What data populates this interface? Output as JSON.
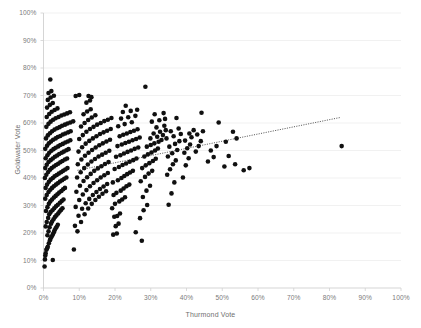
{
  "chart_data": {
    "type": "scatter",
    "title": "",
    "xlabel": "Thurmond Vote",
    "ylabel": "Goldwater Vote",
    "xlim": [
      0,
      100
    ],
    "ylim": [
      0,
      100
    ],
    "xticks": [
      "0%",
      "10%",
      "20%",
      "30%",
      "40%",
      "50%",
      "60%",
      "70%",
      "80%",
      "90%",
      "100%"
    ],
    "yticks": [
      "0%",
      "10%",
      "20%",
      "30%",
      "40%",
      "50%",
      "60%",
      "70%",
      "80%",
      "90%",
      "100%"
    ],
    "grid": "horizontal",
    "grid_color": "#ededed",
    "axis_color": "#d0d0d0",
    "point_color": "#101010",
    "point_size": 2.3,
    "legend": "none",
    "trendline": {
      "style": "dotted",
      "color": "#3f3f3f",
      "x_start": 9.5,
      "y_start": 42.8,
      "x_end": 83.0,
      "y_end": 62.0
    },
    "points": [
      [
        0.3,
        7.8
      ],
      [
        0.4,
        10.4
      ],
      [
        0.5,
        11.8
      ],
      [
        0.6,
        12.6
      ],
      [
        0.8,
        13.9
      ],
      [
        1.0,
        14.4
      ],
      [
        2.6,
        10.2
      ],
      [
        1.2,
        15.0
      ],
      [
        1.5,
        16.3
      ],
      [
        1.8,
        17.4
      ],
      [
        2.0,
        18.1
      ],
      [
        2.3,
        18.7
      ],
      [
        2.6,
        19.5
      ],
      [
        2.9,
        20.3
      ],
      [
        3.1,
        21.0
      ],
      [
        3.4,
        21.7
      ],
      [
        3.7,
        22.3
      ],
      [
        4.0,
        23.0
      ],
      [
        1.1,
        19.2
      ],
      [
        1.4,
        20.6
      ],
      [
        1.7,
        22.1
      ],
      [
        2.1,
        23.4
      ],
      [
        2.4,
        24.2
      ],
      [
        2.8,
        25.0
      ],
      [
        3.2,
        25.8
      ],
      [
        3.6,
        26.4
      ],
      [
        4.1,
        27.1
      ],
      [
        4.5,
        27.8
      ],
      [
        4.9,
        28.4
      ],
      [
        5.3,
        29.0
      ],
      [
        0.6,
        22.4
      ],
      [
        0.9,
        24.0
      ],
      [
        1.3,
        25.5
      ],
      [
        1.6,
        26.8
      ],
      [
        2.0,
        27.6
      ],
      [
        2.5,
        28.3
      ],
      [
        3.0,
        29.0
      ],
      [
        3.5,
        29.7
      ],
      [
        4.0,
        30.3
      ],
      [
        4.6,
        31.0
      ],
      [
        5.1,
        31.6
      ],
      [
        5.6,
        32.2
      ],
      [
        0.7,
        28.0
      ],
      [
        1.1,
        29.4
      ],
      [
        1.5,
        30.6
      ],
      [
        1.9,
        31.5
      ],
      [
        2.4,
        32.2
      ],
      [
        2.9,
        32.9
      ],
      [
        3.4,
        33.5
      ],
      [
        3.9,
        34.1
      ],
      [
        4.4,
        34.7
      ],
      [
        5.0,
        35.3
      ],
      [
        5.5,
        35.9
      ],
      [
        6.0,
        36.4
      ],
      [
        0.5,
        32.5
      ],
      [
        0.9,
        33.8
      ],
      [
        1.4,
        34.9
      ],
      [
        1.9,
        35.7
      ],
      [
        2.4,
        36.4
      ],
      [
        2.9,
        37.0
      ],
      [
        3.5,
        37.6
      ],
      [
        4.0,
        38.1
      ],
      [
        4.6,
        38.7
      ],
      [
        5.2,
        39.2
      ],
      [
        5.8,
        39.7
      ],
      [
        6.4,
        40.2
      ],
      [
        0.6,
        36.4
      ],
      [
        1.0,
        37.6
      ],
      [
        1.5,
        38.6
      ],
      [
        2.0,
        39.4
      ],
      [
        2.6,
        40.0
      ],
      [
        3.1,
        40.6
      ],
      [
        3.7,
        41.1
      ],
      [
        4.3,
        41.6
      ],
      [
        4.9,
        42.1
      ],
      [
        5.5,
        42.6
      ],
      [
        6.1,
        43.1
      ],
      [
        6.7,
        43.6
      ],
      [
        0.4,
        40.0
      ],
      [
        0.8,
        41.2
      ],
      [
        1.3,
        42.2
      ],
      [
        1.8,
        43.0
      ],
      [
        2.3,
        43.6
      ],
      [
        2.9,
        44.2
      ],
      [
        3.5,
        44.7
      ],
      [
        4.1,
        45.2
      ],
      [
        4.7,
        45.7
      ],
      [
        5.3,
        46.2
      ],
      [
        6.0,
        46.7
      ],
      [
        6.6,
        47.1
      ],
      [
        0.5,
        43.6
      ],
      [
        0.9,
        44.8
      ],
      [
        1.4,
        45.8
      ],
      [
        2.0,
        46.5
      ],
      [
        2.6,
        47.1
      ],
      [
        3.2,
        47.7
      ],
      [
        3.8,
        48.2
      ],
      [
        4.4,
        48.7
      ],
      [
        5.1,
        49.2
      ],
      [
        5.7,
        49.6
      ],
      [
        6.4,
        50.1
      ],
      [
        7.0,
        50.5
      ],
      [
        0.6,
        47.2
      ],
      [
        1.1,
        48.3
      ],
      [
        1.6,
        49.2
      ],
      [
        2.2,
        49.9
      ],
      [
        2.8,
        50.5
      ],
      [
        3.4,
        51.0
      ],
      [
        4.1,
        51.5
      ],
      [
        4.7,
        52.0
      ],
      [
        5.4,
        52.4
      ],
      [
        6.1,
        52.9
      ],
      [
        6.8,
        53.3
      ],
      [
        7.5,
        53.7
      ],
      [
        0.5,
        50.6
      ],
      [
        1.0,
        51.7
      ],
      [
        1.5,
        52.6
      ],
      [
        2.1,
        53.3
      ],
      [
        2.7,
        53.9
      ],
      [
        3.4,
        54.4
      ],
      [
        4.0,
        54.9
      ],
      [
        4.7,
        55.3
      ],
      [
        5.4,
        55.8
      ],
      [
        6.1,
        56.2
      ],
      [
        6.9,
        56.6
      ],
      [
        7.6,
        57.0
      ],
      [
        0.7,
        54.4
      ],
      [
        1.2,
        55.5
      ],
      [
        1.8,
        56.3
      ],
      [
        2.4,
        57.0
      ],
      [
        3.1,
        57.6
      ],
      [
        3.8,
        58.1
      ],
      [
        4.5,
        58.5
      ],
      [
        5.2,
        59.0
      ],
      [
        6.0,
        59.4
      ],
      [
        6.7,
        59.8
      ],
      [
        7.5,
        60.2
      ],
      [
        8.3,
        60.6
      ],
      [
        0.8,
        58.6
      ],
      [
        1.4,
        59.7
      ],
      [
        2.0,
        60.5
      ],
      [
        2.7,
        61.2
      ],
      [
        3.4,
        61.7
      ],
      [
        4.2,
        62.2
      ],
      [
        5.0,
        62.7
      ],
      [
        5.8,
        63.1
      ],
      [
        6.6,
        63.5
      ],
      [
        7.4,
        63.9
      ],
      [
        0.9,
        62.2
      ],
      [
        1.6,
        63.3
      ],
      [
        2.3,
        64.1
      ],
      [
        3.1,
        64.7
      ],
      [
        3.9,
        65.3
      ],
      [
        1.0,
        65.6
      ],
      [
        1.8,
        66.6
      ],
      [
        2.6,
        67.3
      ],
      [
        1.2,
        68.4
      ],
      [
        2.0,
        69.3
      ],
      [
        2.9,
        69.9
      ],
      [
        1.4,
        70.9
      ],
      [
        2.2,
        71.6
      ],
      [
        1.9,
        75.8
      ],
      [
        8.5,
        14.0
      ],
      [
        9.5,
        20.6
      ],
      [
        10.5,
        24.0
      ],
      [
        11.5,
        26.8
      ],
      [
        12.5,
        28.9
      ],
      [
        13.5,
        30.6
      ],
      [
        14.5,
        32.0
      ],
      [
        15.5,
        33.2
      ],
      [
        16.5,
        34.3
      ],
      [
        17.5,
        35.2
      ],
      [
        8.8,
        22.6
      ],
      [
        9.8,
        26.3
      ],
      [
        10.8,
        28.8
      ],
      [
        11.8,
        30.8
      ],
      [
        12.8,
        32.4
      ],
      [
        13.8,
        33.8
      ],
      [
        14.8,
        34.9
      ],
      [
        15.8,
        36.0
      ],
      [
        16.8,
        36.9
      ],
      [
        17.8,
        37.8
      ],
      [
        9.0,
        29.5
      ],
      [
        10.0,
        32.0
      ],
      [
        11.0,
        34.0
      ],
      [
        12.0,
        35.6
      ],
      [
        13.0,
        37.0
      ],
      [
        14.0,
        38.2
      ],
      [
        15.0,
        39.2
      ],
      [
        16.0,
        40.2
      ],
      [
        17.0,
        41.0
      ],
      [
        18.0,
        41.8
      ],
      [
        9.2,
        35.0
      ],
      [
        10.2,
        37.2
      ],
      [
        11.2,
        38.9
      ],
      [
        12.2,
        40.3
      ],
      [
        13.2,
        41.5
      ],
      [
        14.2,
        42.6
      ],
      [
        15.2,
        43.5
      ],
      [
        16.2,
        44.3
      ],
      [
        17.2,
        45.1
      ],
      [
        18.2,
        45.8
      ],
      [
        9.4,
        40.2
      ],
      [
        10.4,
        42.1
      ],
      [
        11.4,
        43.6
      ],
      [
        12.4,
        44.9
      ],
      [
        13.4,
        46.0
      ],
      [
        14.4,
        46.9
      ],
      [
        15.4,
        47.8
      ],
      [
        16.4,
        48.5
      ],
      [
        17.4,
        49.2
      ],
      [
        18.4,
        49.9
      ],
      [
        9.6,
        45.0
      ],
      [
        10.6,
        46.7
      ],
      [
        11.6,
        48.1
      ],
      [
        12.6,
        49.2
      ],
      [
        13.6,
        50.2
      ],
      [
        14.6,
        51.1
      ],
      [
        15.6,
        51.9
      ],
      [
        16.6,
        52.6
      ],
      [
        17.6,
        53.3
      ],
      [
        18.6,
        53.9
      ],
      [
        9.8,
        49.6
      ],
      [
        10.8,
        51.2
      ],
      [
        11.8,
        52.5
      ],
      [
        12.8,
        53.5
      ],
      [
        13.8,
        54.4
      ],
      [
        14.8,
        55.2
      ],
      [
        15.8,
        56.0
      ],
      [
        16.8,
        56.6
      ],
      [
        17.8,
        57.2
      ],
      [
        18.8,
        57.8
      ],
      [
        10.0,
        54.2
      ],
      [
        11.0,
        55.6
      ],
      [
        12.0,
        56.8
      ],
      [
        13.0,
        57.8
      ],
      [
        14.0,
        58.6
      ],
      [
        15.0,
        59.4
      ],
      [
        16.0,
        60.0
      ],
      [
        17.0,
        60.7
      ],
      [
        18.0,
        61.2
      ],
      [
        19.0,
        61.8
      ],
      [
        10.5,
        58.7
      ],
      [
        11.5,
        60.0
      ],
      [
        12.5,
        61.1
      ],
      [
        13.5,
        62.0
      ],
      [
        14.5,
        62.8
      ],
      [
        11.2,
        63.2
      ],
      [
        12.2,
        64.2
      ],
      [
        13.2,
        65.0
      ],
      [
        12.0,
        67.4
      ],
      [
        13.0,
        68.2
      ],
      [
        12.6,
        69.8
      ],
      [
        13.4,
        69.4
      ],
      [
        9.0,
        69.8
      ],
      [
        10.0,
        70.2
      ],
      [
        19.5,
        19.4
      ],
      [
        20.5,
        19.8
      ],
      [
        20.2,
        22.5
      ],
      [
        21.0,
        23.4
      ],
      [
        19.8,
        25.9
      ],
      [
        20.6,
        26.2
      ],
      [
        21.4,
        27.1
      ],
      [
        19.2,
        29.0
      ],
      [
        20.0,
        30.6
      ],
      [
        21.2,
        31.5
      ],
      [
        22.0,
        32.2
      ],
      [
        22.8,
        33.0
      ],
      [
        19.6,
        33.8
      ],
      [
        20.4,
        34.6
      ],
      [
        21.6,
        35.4
      ],
      [
        22.4,
        36.2
      ],
      [
        23.2,
        37.0
      ],
      [
        24.0,
        37.6
      ],
      [
        19.4,
        38.4
      ],
      [
        20.8,
        39.2
      ],
      [
        21.8,
        40.0
      ],
      [
        22.6,
        40.7
      ],
      [
        23.4,
        41.4
      ],
      [
        24.2,
        42.0
      ],
      [
        25.0,
        42.6
      ],
      [
        19.9,
        43.3
      ],
      [
        21.1,
        44.0
      ],
      [
        22.1,
        44.7
      ],
      [
        23.1,
        45.3
      ],
      [
        24.1,
        45.9
      ],
      [
        25.1,
        46.5
      ],
      [
        26.0,
        47.1
      ],
      [
        20.3,
        47.7
      ],
      [
        21.5,
        48.3
      ],
      [
        22.5,
        48.9
      ],
      [
        23.5,
        49.5
      ],
      [
        24.5,
        50.0
      ],
      [
        25.5,
        50.6
      ],
      [
        26.5,
        51.1
      ],
      [
        20.7,
        51.6
      ],
      [
        21.9,
        52.2
      ],
      [
        22.9,
        52.7
      ],
      [
        23.9,
        53.2
      ],
      [
        24.9,
        53.7
      ],
      [
        25.9,
        54.2
      ],
      [
        26.9,
        54.7
      ],
      [
        21.3,
        55.2
      ],
      [
        22.3,
        55.7
      ],
      [
        23.3,
        56.2
      ],
      [
        24.3,
        56.7
      ],
      [
        25.3,
        57.2
      ],
      [
        26.3,
        57.7
      ],
      [
        20.9,
        58.8
      ],
      [
        22.7,
        59.6
      ],
      [
        24.7,
        60.3
      ],
      [
        21.7,
        61.6
      ],
      [
        23.7,
        62.1
      ],
      [
        25.7,
        62.6
      ],
      [
        22.2,
        64.0
      ],
      [
        24.4,
        64.4
      ],
      [
        26.2,
        64.8
      ],
      [
        23.0,
        66.3
      ],
      [
        28.5,
        73.2
      ],
      [
        27.5,
        17.2
      ],
      [
        25.8,
        20.3
      ],
      [
        27.0,
        25.4
      ],
      [
        28.0,
        28.3
      ],
      [
        29.0,
        30.2
      ],
      [
        27.8,
        33.1
      ],
      [
        28.8,
        35.4
      ],
      [
        29.8,
        37.2
      ],
      [
        27.2,
        38.8
      ],
      [
        28.4,
        40.4
      ],
      [
        29.4,
        41.6
      ],
      [
        30.4,
        42.6
      ],
      [
        27.6,
        43.6
      ],
      [
        28.6,
        44.6
      ],
      [
        29.6,
        45.4
      ],
      [
        30.6,
        46.2
      ],
      [
        31.4,
        47.0
      ],
      [
        28.2,
        47.8
      ],
      [
        29.2,
        48.6
      ],
      [
        30.2,
        49.3
      ],
      [
        31.2,
        50.0
      ],
      [
        32.0,
        50.7
      ],
      [
        28.9,
        51.4
      ],
      [
        30.0,
        52.0
      ],
      [
        31.0,
        52.6
      ],
      [
        32.2,
        53.2
      ],
      [
        33.0,
        53.8
      ],
      [
        29.9,
        54.4
      ],
      [
        31.8,
        55.0
      ],
      [
        33.4,
        55.6
      ],
      [
        30.8,
        56.2
      ],
      [
        32.6,
        56.8
      ],
      [
        34.2,
        57.4
      ],
      [
        31.6,
        58.4
      ],
      [
        33.8,
        59.0
      ],
      [
        30.3,
        60.5
      ],
      [
        32.4,
        61.0
      ],
      [
        34.0,
        61.5
      ],
      [
        31.1,
        63.2
      ],
      [
        33.6,
        63.6
      ],
      [
        35.0,
        30.3
      ],
      [
        35.8,
        34.4
      ],
      [
        36.6,
        38.4
      ],
      [
        34.6,
        41.2
      ],
      [
        35.4,
        43.2
      ],
      [
        36.2,
        45.0
      ],
      [
        37.0,
        46.4
      ],
      [
        34.8,
        47.8
      ],
      [
        36.0,
        49.0
      ],
      [
        37.4,
        50.2
      ],
      [
        35.2,
        51.4
      ],
      [
        36.8,
        52.4
      ],
      [
        38.0,
        53.4
      ],
      [
        34.4,
        54.4
      ],
      [
        36.4,
        55.2
      ],
      [
        38.4,
        56.0
      ],
      [
        35.6,
        57.0
      ],
      [
        37.8,
        58.0
      ],
      [
        37.2,
        61.8
      ],
      [
        39.0,
        40.2
      ],
      [
        39.8,
        44.6
      ],
      [
        40.6,
        47.2
      ],
      [
        39.4,
        49.2
      ],
      [
        40.2,
        50.8
      ],
      [
        41.0,
        52.2
      ],
      [
        39.6,
        53.6
      ],
      [
        41.4,
        54.8
      ],
      [
        40.8,
        56.2
      ],
      [
        42.0,
        57.4
      ],
      [
        42.6,
        49.6
      ],
      [
        43.4,
        51.6
      ],
      [
        44.0,
        53.4
      ],
      [
        43.0,
        55.8
      ],
      [
        44.6,
        57.0
      ],
      [
        44.2,
        63.7
      ],
      [
        46.0,
        46.0
      ],
      [
        46.8,
        50.0
      ],
      [
        47.6,
        47.6
      ],
      [
        48.4,
        51.6
      ],
      [
        50.6,
        44.2
      ],
      [
        51.8,
        48.0
      ],
      [
        53.6,
        45.0
      ],
      [
        56.0,
        42.8
      ],
      [
        57.6,
        43.6
      ],
      [
        49.0,
        60.2
      ],
      [
        51.0,
        53.2
      ],
      [
        53.0,
        56.8
      ],
      [
        54.0,
        54.4
      ],
      [
        83.4,
        51.6
      ]
    ]
  },
  "axes": {
    "x_title": "Thurmond Vote",
    "y_title": "Goldwater Vote"
  }
}
